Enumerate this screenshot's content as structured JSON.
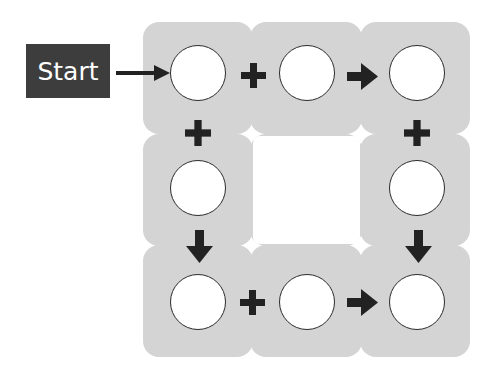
{
  "start_label": "Start",
  "colors": {
    "tile": "#d4d4d4",
    "start_bg": "#3d3d3d",
    "symbol": "#222222"
  },
  "grid": {
    "rows": [
      {
        "cells": [
          "circle",
          "plus",
          "circle",
          "arrow-right",
          "circle"
        ]
      },
      {
        "cells": [
          "circle",
          "empty",
          "circle"
        ]
      },
      {
        "cells": [
          "circle",
          "plus",
          "circle",
          "arrow-right",
          "circle"
        ]
      }
    ],
    "connectors": [
      "start-arrow-right",
      "left-plus-down",
      "right-plus-down",
      "left-arrow-down",
      "right-arrow-down"
    ]
  }
}
